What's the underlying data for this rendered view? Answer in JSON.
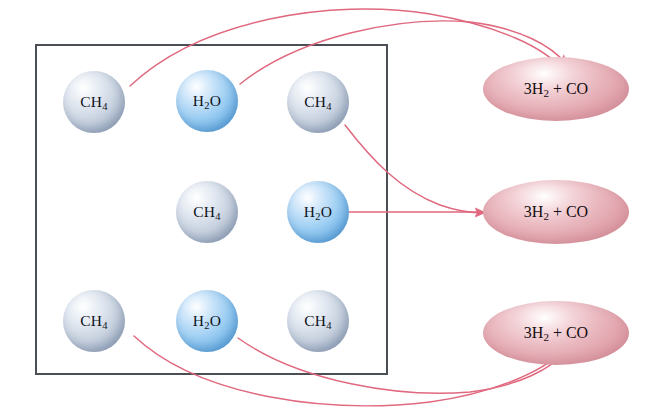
{
  "diagram": {
    "reactant_box": {
      "name": "reactant-container"
    },
    "colors": {
      "arrow": "#e0687f",
      "box_border": "#4a4f55",
      "ch4_sphere": "#c6d0de",
      "h2o_sphere": "#9bcdf2",
      "product_ellipse": "#eab9c0"
    },
    "reactants": [
      {
        "id": "r1",
        "formula": "CH",
        "sub": "4",
        "species": "methane",
        "type": "ch4",
        "x": 63,
        "y": 71
      },
      {
        "id": "r2",
        "formula": "H",
        "sub": "2",
        "tail": "O",
        "species": "water",
        "type": "h2o",
        "x": 176,
        "y": 70
      },
      {
        "id": "r3",
        "formula": "CH",
        "sub": "4",
        "species": "methane",
        "type": "ch4",
        "x": 287,
        "y": 71
      },
      {
        "id": "r4",
        "formula": "CH",
        "sub": "4",
        "species": "methane",
        "type": "ch4",
        "x": 176,
        "y": 181
      },
      {
        "id": "r5",
        "formula": "H",
        "sub": "2",
        "tail": "O",
        "species": "water",
        "type": "h2o",
        "x": 287,
        "y": 181
      },
      {
        "id": "r6",
        "formula": "CH",
        "sub": "4",
        "species": "methane",
        "type": "ch4",
        "x": 63,
        "y": 290
      },
      {
        "id": "r7",
        "formula": "H",
        "sub": "2",
        "tail": "O",
        "species": "water",
        "type": "h2o",
        "x": 176,
        "y": 290
      },
      {
        "id": "r8",
        "formula": "CH",
        "sub": "4",
        "species": "methane",
        "type": "ch4",
        "x": 287,
        "y": 290
      }
    ],
    "products": [
      {
        "id": "p1",
        "prefix": "3H",
        "sub": "2",
        "tail": " + CO",
        "x": 483,
        "y": 57
      },
      {
        "id": "p2",
        "prefix": "3H",
        "sub": "2",
        "tail": " + CO",
        "x": 483,
        "y": 180
      },
      {
        "id": "p3",
        "prefix": "3H",
        "sub": "2",
        "tail": " + CO",
        "x": 483,
        "y": 301
      }
    ],
    "arrows": [
      {
        "id": "a1",
        "from": "r1",
        "to": "p1",
        "path": "M 130 86 C 200 20 330 -2 430 14 C 500 26 545 48 563 70"
      },
      {
        "id": "a2",
        "from": "r2",
        "to": "p1",
        "path": "M 240 84 C 300 36 400 16 470 22 C 520 28 552 46 566 64"
      },
      {
        "id": "a3",
        "from": "r3",
        "to": "p2",
        "path": "M 345 125 C 372 160 400 190 440 205 C 460 212 475 213 484 213"
      },
      {
        "id": "a4",
        "from": "r5",
        "to": "p2",
        "path": "M 344 212 L 484 212"
      },
      {
        "id": "a5",
        "from": "r6",
        "to": "p3",
        "path": "M 134 336 C 200 398 330 414 430 402 C 495 393 545 371 566 348"
      },
      {
        "id": "a6",
        "from": "r7",
        "to": "p3",
        "path": "M 238 338 C 300 382 400 398 470 392 C 520 386 552 368 568 350"
      }
    ]
  }
}
